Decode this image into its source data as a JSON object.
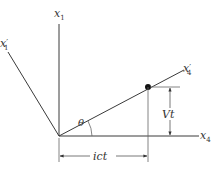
{
  "diagram": {
    "colors": {
      "line": "#3a3a3a",
      "dimension": "#666666",
      "text": "#333333",
      "background": "#ffffff"
    },
    "axes": {
      "x1": {
        "label": "x",
        "subscript": "1"
      },
      "x1_prime": {
        "label": "x",
        "subscript": "1",
        "prime": "′"
      },
      "x4": {
        "label": "x",
        "subscript": "4"
      },
      "x4_prime": {
        "label": "x",
        "subscript": "4",
        "prime": "′"
      }
    },
    "angle_label": "θ",
    "dimensions": {
      "vertical": "Vt",
      "horizontal": "ict"
    },
    "point": {
      "shape": "filled-dot"
    }
  }
}
